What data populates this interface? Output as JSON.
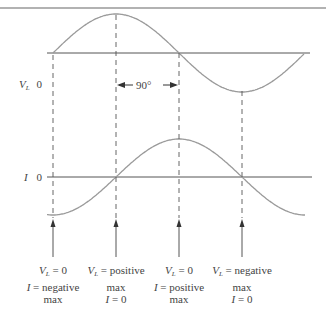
{
  "diagram": {
    "title": "",
    "phase_label": "90°",
    "colors": {
      "curve": "#9a9a9a",
      "axis": "#555555",
      "dash": "#555555",
      "border": "#666666"
    },
    "waveforms": [
      {
        "name": "VL",
        "label_sym": "V",
        "label_sub": "L",
        "zero": "0",
        "shape": "sine",
        "axis_y": 53,
        "amplitude": 39
      },
      {
        "name": "I",
        "label_sym": "I",
        "label_sub": "",
        "zero": "0",
        "shape": "negative-cosine",
        "axis_y": 177,
        "amplitude": 38
      }
    ],
    "markers": [
      {
        "x": 53,
        "lines": [
          {
            "sym": "V",
            "sub": "L",
            "rest": " = 0"
          },
          {
            "sym": "I",
            "sub": "",
            "rest": " = negative"
          },
          {
            "sym": "",
            "sub": "",
            "rest": "max"
          }
        ]
      },
      {
        "x": 116,
        "lines": [
          {
            "sym": "V",
            "sub": "L",
            "rest": " = positive"
          },
          {
            "sym": "",
            "sub": "",
            "rest": "max"
          },
          {
            "sym": "I",
            "sub": "",
            "rest": " = 0"
          }
        ]
      },
      {
        "x": 179,
        "lines": [
          {
            "sym": "V",
            "sub": "L",
            "rest": " = 0"
          },
          {
            "sym": "I",
            "sub": "",
            "rest": " = positive"
          },
          {
            "sym": "",
            "sub": "",
            "rest": "max"
          }
        ]
      },
      {
        "x": 242,
        "lines": [
          {
            "sym": "V",
            "sub": "L",
            "rest": " = negative"
          },
          {
            "sym": "",
            "sub": "",
            "rest": "max"
          },
          {
            "sym": "I",
            "sub": "",
            "rest": " = 0"
          }
        ]
      }
    ]
  }
}
